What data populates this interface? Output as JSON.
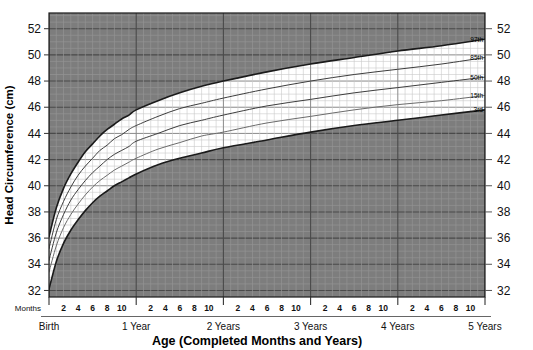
{
  "chart_data": {
    "type": "line",
    "title": "",
    "xlabel": "Age (Completed Months and Years)",
    "ylabel": "Head Circumference (cm)",
    "xlim": [
      0,
      60
    ],
    "ylim": [
      31.5,
      53.2
    ],
    "grid": true,
    "grid_major_y_step": 2,
    "grid_minor_y_step": 0.5,
    "grid_major_x_step": 12,
    "grid_minor_x_step": 1,
    "legend_position": "right-inline",
    "x_unit": "months",
    "y_ticks": [
      32,
      34,
      36,
      38,
      40,
      42,
      44,
      46,
      48,
      50,
      52
    ],
    "y_ticks_right": [
      32,
      34,
      36,
      38,
      40,
      42,
      44,
      46,
      48,
      50,
      52
    ],
    "x_minor_tick_labels": [
      "2",
      "4",
      "6",
      "8",
      "10"
    ],
    "x_year_labels": [
      "Birth",
      "1 Year",
      "2 Years",
      "3 Years",
      "4 Years",
      "5 Years"
    ],
    "x_axis_unit_label": "Months",
    "x_sample_months": [
      0,
      1,
      2,
      3,
      4,
      5,
      6,
      7,
      8,
      9,
      10,
      11,
      12,
      15,
      18,
      21,
      24,
      30,
      36,
      42,
      48,
      54,
      60
    ],
    "series": [
      {
        "name": "97th",
        "label": "97th",
        "color": "#1a1a1a",
        "width": 1.6,
        "values": [
          36.1,
          38.3,
          39.8,
          40.9,
          41.8,
          42.6,
          43.2,
          43.8,
          44.3,
          44.7,
          45.1,
          45.4,
          45.8,
          46.5,
          47.1,
          47.6,
          48.0,
          48.7,
          49.3,
          49.8,
          50.3,
          50.7,
          51.2
        ]
      },
      {
        "name": "85th",
        "label": "85th",
        "color": "#3d3d3d",
        "width": 1.0,
        "values": [
          35.2,
          37.4,
          38.8,
          39.9,
          40.8,
          41.5,
          42.1,
          42.7,
          43.1,
          43.6,
          43.9,
          44.3,
          44.6,
          45.3,
          45.9,
          46.3,
          46.7,
          47.4,
          48.0,
          48.5,
          48.9,
          49.3,
          49.8
        ]
      },
      {
        "name": "50th",
        "label": "50th",
        "color": "#3d3d3d",
        "width": 1.0,
        "values": [
          34.3,
          36.4,
          37.8,
          38.9,
          39.7,
          40.4,
          41.0,
          41.5,
          42.0,
          42.4,
          42.7,
          43.0,
          43.4,
          44.0,
          44.6,
          45.0,
          45.4,
          46.1,
          46.6,
          47.1,
          47.5,
          47.9,
          48.3
        ]
      },
      {
        "name": "15th",
        "label": "15th",
        "color": "#6b6b6b",
        "width": 1.0,
        "values": [
          33.4,
          35.4,
          36.8,
          37.8,
          38.6,
          39.3,
          39.9,
          40.4,
          40.8,
          41.2,
          41.5,
          41.8,
          42.1,
          42.8,
          43.3,
          43.8,
          44.1,
          44.8,
          45.3,
          45.8,
          46.2,
          46.5,
          46.9
        ]
      },
      {
        "name": "3rd",
        "label": "3rd",
        "color": "#1a1a1a",
        "width": 1.6,
        "values": [
          32.1,
          34.2,
          35.6,
          36.6,
          37.4,
          38.1,
          38.7,
          39.2,
          39.6,
          40.0,
          40.3,
          40.6,
          40.9,
          41.6,
          42.1,
          42.5,
          42.9,
          43.5,
          44.1,
          44.6,
          45.0,
          45.4,
          45.8
        ]
      }
    ]
  },
  "colors": {
    "plot_background": "#7d7d7d",
    "band_background": "#ffffff",
    "grid_minor": "#949494",
    "grid_major": "#4a4a4a",
    "band_grid_minor": "#c9c9c9",
    "band_grid_major": "#8a8a8a",
    "axis_line": "#1a1a1a",
    "text": "#111111"
  }
}
